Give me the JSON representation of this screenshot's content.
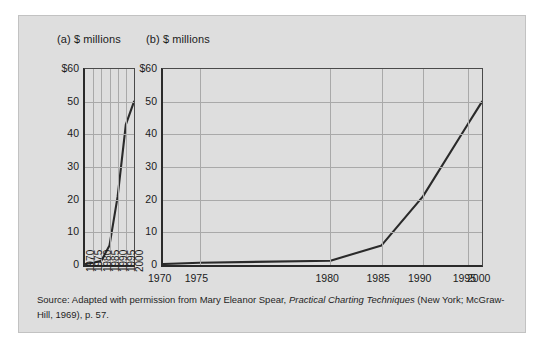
{
  "figure": {
    "background_color": "#dedede",
    "line_color": "#2a2a2a",
    "grid_color": "#a9a9a9",
    "source_note_prefix": "Source: Adapted with permission from Mary Eleanor Spear, ",
    "source_note_italic": "Practical Charting Techniques",
    "source_note_suffix": " (New York; McGraw-Hill, 1969), p. 57."
  },
  "chart_data": [
    {
      "type": "line",
      "panel": "a",
      "title": "(a) $ millions",
      "xlabel": "",
      "ylabel": "$ millions",
      "x": [
        1970,
        1975,
        1980,
        1985,
        1990,
        1995,
        2000
      ],
      "values": [
        0.3,
        0.7,
        1.3,
        6,
        21,
        43,
        50
      ],
      "xtick_labels": [
        "1970",
        "1975",
        "1980",
        "1985",
        "1990",
        "1995",
        "2000"
      ],
      "ytick_labels": [
        "$60",
        "50",
        "40",
        "30",
        "20",
        "10",
        "0"
      ],
      "yticks": [
        60,
        50,
        40,
        30,
        20,
        10,
        0
      ],
      "ylim": [
        0,
        60
      ],
      "xlim": [
        1970,
        2000
      ],
      "grid": "both",
      "xtick_rotation": -90,
      "aspect_note": "narrow horizontal scale exaggerates the rise"
    },
    {
      "type": "line",
      "panel": "b",
      "title": "(b) $ millions",
      "xlabel": "",
      "ylabel": "$ millions",
      "x": [
        1970,
        1975,
        1980,
        1985,
        1990,
        1995,
        2000
      ],
      "values": [
        0.3,
        0.7,
        1.3,
        6,
        21,
        43,
        50
      ],
      "xtick_labels": [
        "1970",
        "1975",
        "1980",
        "1985",
        "1990",
        "1995",
        "2000"
      ],
      "xtick_positions_pct": [
        0,
        11.5,
        52.5,
        68.5,
        81.5,
        95.5,
        100
      ],
      "ytick_labels": [
        "$60",
        "50",
        "40",
        "30",
        "20",
        "10",
        "0"
      ],
      "yticks": [
        60,
        50,
        40,
        30,
        20,
        10,
        0
      ],
      "ylim": [
        0,
        60
      ],
      "xlim": [
        1970,
        2000
      ],
      "grid": "both",
      "xtick_rotation": 0,
      "aspect_note": "wide horizontal scale flattens the rise"
    }
  ]
}
